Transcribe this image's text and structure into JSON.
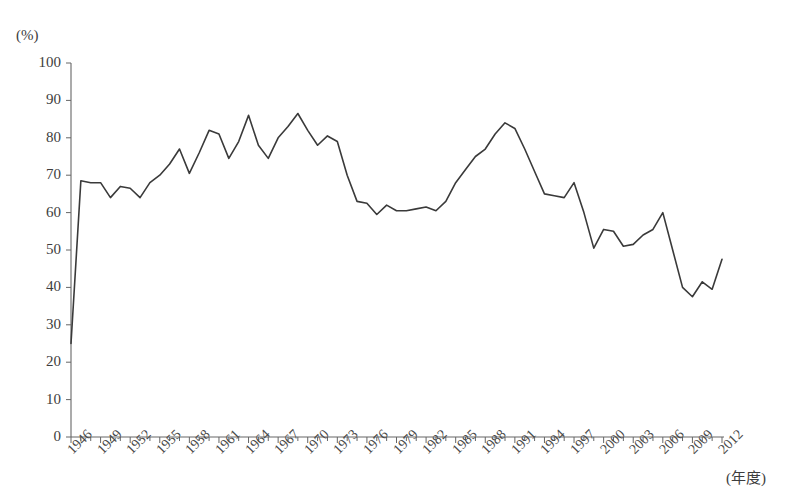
{
  "chart_data": {
    "type": "line",
    "title": "",
    "subtitle": "",
    "xlabel": "(年度)",
    "ylabel": "(%)",
    "ylim": [
      0,
      100
    ],
    "xlim": [
      1946,
      2012
    ],
    "grid": false,
    "legend": null,
    "y_ticks": [
      0,
      10,
      20,
      30,
      40,
      50,
      60,
      70,
      80,
      90,
      100
    ],
    "x_tick_labels": [
      "1946",
      "1949",
      "1952",
      "1955",
      "1958",
      "1961",
      "1964",
      "1967",
      "1970",
      "1973",
      "1976",
      "1979",
      "1982",
      "1985",
      "1988",
      "1991",
      "1994",
      "1997",
      "2000",
      "2003",
      "2006",
      "2009",
      "2012"
    ],
    "x_tick_step_years": 3,
    "x_minor_tick_step_years": 1,
    "line_color": "#3a3a3a",
    "line_width": 1.6,
    "series": [
      {
        "name": "",
        "x": [
          1946,
          1947,
          1948,
          1949,
          1950,
          1951,
          1952,
          1953,
          1954,
          1955,
          1956,
          1957,
          1958,
          1959,
          1960,
          1961,
          1962,
          1963,
          1964,
          1965,
          1966,
          1967,
          1968,
          1969,
          1970,
          1971,
          1972,
          1973,
          1974,
          1975,
          1976,
          1977,
          1978,
          1979,
          1980,
          1981,
          1982,
          1983,
          1984,
          1985,
          1986,
          1987,
          1988,
          1989,
          1990,
          1991,
          1992,
          1993,
          1994,
          1995,
          1996,
          1997,
          1998,
          1999,
          2000,
          2001,
          2002,
          2003,
          2004,
          2005,
          2006,
          2007,
          2008,
          2009,
          2010,
          2011,
          2012
        ],
        "values": [
          25.0,
          68.5,
          68.0,
          68.0,
          64.0,
          67.0,
          66.5,
          64.0,
          68.0,
          70.0,
          73.0,
          77.0,
          70.5,
          76.0,
          82.0,
          81.0,
          74.5,
          79.0,
          86.0,
          78.0,
          74.5,
          80.0,
          83.0,
          86.5,
          82.0,
          78.0,
          80.5,
          79.0,
          70.0,
          63.0,
          62.5,
          59.5,
          62.0,
          60.5,
          60.5,
          61.0,
          61.5,
          60.5,
          63.0,
          68.0,
          71.5,
          75.0,
          77.0,
          81.0,
          84.0,
          82.5,
          77.0,
          71.0,
          65.0,
          64.5,
          64.0,
          68.0,
          60.0,
          50.5,
          55.5,
          55.0,
          51.0,
          51.5,
          54.0,
          55.5,
          60.0,
          50.0,
          40.0,
          37.5,
          41.5,
          39.5,
          47.5
        ]
      }
    ]
  }
}
